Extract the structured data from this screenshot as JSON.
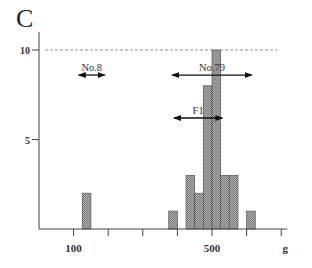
{
  "panel_label": "C",
  "chart_data": {
    "type": "bar",
    "title": "",
    "xlabel": "g",
    "ylabel": "",
    "xlim": [
      0,
      700
    ],
    "ylim": [
      0,
      10
    ],
    "x_ticks": [
      100,
      200,
      300,
      400,
      500,
      600,
      700
    ],
    "x_tick_labels": {
      "100": "100",
      "500": "500",
      "700": "g"
    },
    "y_ticks": [
      5,
      10
    ],
    "y_tick_labels": [
      "5",
      "10"
    ],
    "bin_width": 25,
    "bins": [
      {
        "start": 125,
        "end": 150,
        "count": 2
      },
      {
        "start": 375,
        "end": 400,
        "count": 1
      },
      {
        "start": 425,
        "end": 450,
        "count": 3
      },
      {
        "start": 450,
        "end": 475,
        "count": 2
      },
      {
        "start": 475,
        "end": 500,
        "count": 8
      },
      {
        "start": 500,
        "end": 525,
        "count": 10
      },
      {
        "start": 525,
        "end": 550,
        "count": 3
      },
      {
        "start": 550,
        "end": 575,
        "count": 3
      },
      {
        "start": 600,
        "end": 625,
        "count": 1
      }
    ],
    "reference_line": {
      "y": 10,
      "style": "dashed"
    },
    "annotations": [
      {
        "label": "No.8",
        "type": "range-arrow",
        "x_start": 115,
        "x_end": 190,
        "y": 8.6
      },
      {
        "label": "No.79",
        "type": "range-arrow",
        "x_start": 385,
        "x_end": 615,
        "y": 8.6
      },
      {
        "label": "F1",
        "type": "range-arrow",
        "x_start": 390,
        "x_end": 530,
        "y": 6.2
      }
    ],
    "bar_fill": "#9a9a9a",
    "bar_stroke": "#555555"
  }
}
